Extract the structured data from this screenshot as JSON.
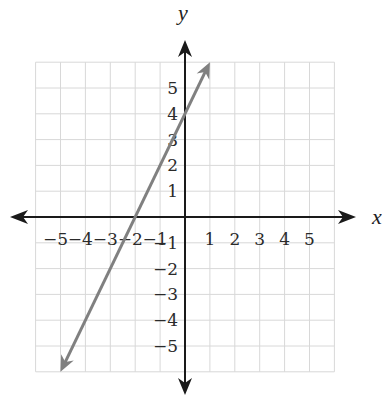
{
  "chart_data": {
    "type": "line",
    "title": "",
    "xlabel": "x",
    "ylabel": "y",
    "xlim": [
      -6,
      6
    ],
    "ylim": [
      -6,
      6
    ],
    "grid": true,
    "x_ticks": [
      "-5",
      "-4",
      "-3",
      "-2",
      "-1",
      "1",
      "2",
      "3",
      "4",
      "5"
    ],
    "y_ticks": [
      "5",
      "4",
      "3",
      "2",
      "1",
      "-1",
      "-2",
      "-3",
      "-4",
      "-5"
    ],
    "series": [
      {
        "name": "y = 2x + 4",
        "equation": "y = 2x + 4",
        "slope": 2,
        "y_intercept": 4,
        "x_intercept": -2,
        "x": [
          -5,
          -2,
          0,
          1
        ],
        "y": [
          -6,
          0,
          4,
          6
        ],
        "arrows": "both",
        "color": "#808080"
      }
    ]
  },
  "colors": {
    "axis": "#1a1a1a",
    "grid": "#d8d8d8",
    "line": "#808080"
  }
}
